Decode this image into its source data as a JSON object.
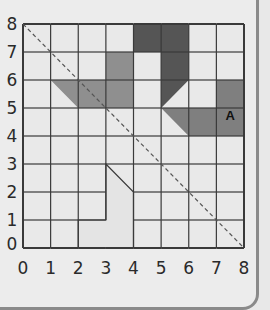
{
  "diagram": {
    "type": "coordinate-grid",
    "x_range": [
      0,
      8
    ],
    "y_range": [
      0,
      8
    ],
    "x_ticks": [
      "0",
      "1",
      "2",
      "3",
      "4",
      "5",
      "6",
      "7",
      "8"
    ],
    "y_ticks": [
      "0",
      "1",
      "2",
      "3",
      "4",
      "5",
      "6",
      "7",
      "8"
    ],
    "mirror_line": {
      "from": [
        0,
        8
      ],
      "to": [
        8,
        0
      ],
      "style": "dashed"
    },
    "shapes": [
      {
        "id": "shape-dark",
        "label": "",
        "color": "#555555",
        "points": [
          [
            4,
            8
          ],
          [
            6,
            8
          ],
          [
            6,
            6
          ],
          [
            5,
            5
          ],
          [
            5,
            7
          ],
          [
            4,
            7
          ]
        ]
      },
      {
        "id": "shape-medium",
        "label": "",
        "color": "#8f8f8f",
        "points": [
          [
            3,
            7
          ],
          [
            4,
            7
          ],
          [
            4,
            5
          ],
          [
            2,
            5
          ],
          [
            1,
            6
          ],
          [
            3,
            6
          ]
        ]
      },
      {
        "id": "shape-a",
        "label": "A",
        "label_at": [
          7.5,
          4.75
        ],
        "color": "#7f7f7f",
        "points": [
          [
            7,
            6
          ],
          [
            8,
            6
          ],
          [
            8,
            4
          ],
          [
            6,
            4
          ],
          [
            5,
            5
          ],
          [
            7,
            5
          ]
        ]
      },
      {
        "id": "shape-light",
        "label": "",
        "color": "#e4e4e4",
        "points": [
          [
            2,
            0
          ],
          [
            2,
            1
          ],
          [
            3,
            1
          ],
          [
            3,
            3
          ],
          [
            4,
            2
          ],
          [
            4,
            0
          ]
        ]
      }
    ],
    "grid_color": "#3a3a3a",
    "cell_color": "#e9e9e9"
  }
}
